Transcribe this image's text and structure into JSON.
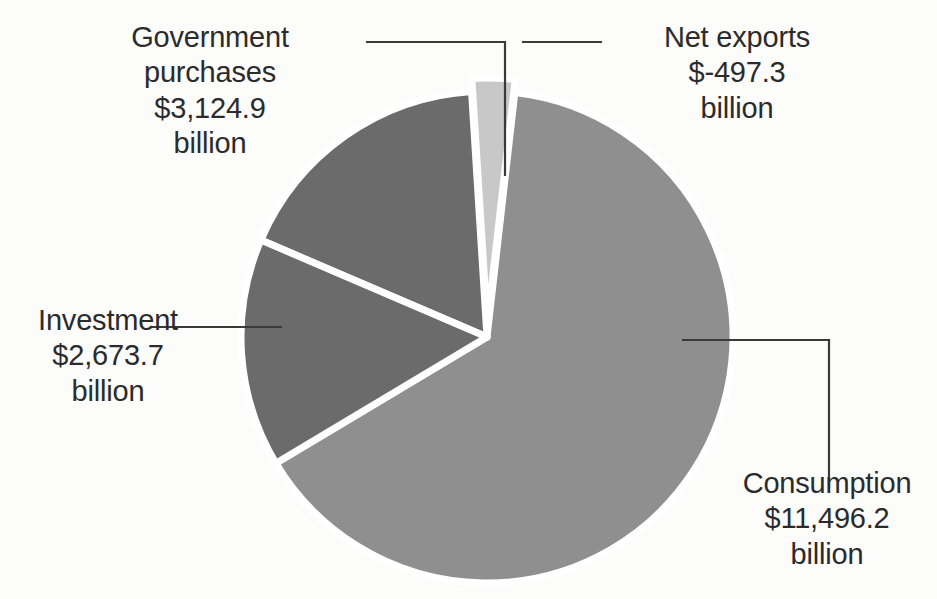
{
  "chart_data": {
    "type": "pie",
    "title": "",
    "subtitle": "",
    "xlabel": "",
    "ylabel": "",
    "units": "billion",
    "currency_symbol": "$",
    "legend_position": "callouts",
    "grid": false,
    "categories": [
      "Consumption",
      "Government purchases",
      "Investment",
      "Net exports"
    ],
    "values": [
      11496.2,
      3124.9,
      2673.7,
      -497.3
    ],
    "slices": [
      {
        "label": "Consumption",
        "value_text": "$11,496.2",
        "unit_text": "billion",
        "value": 11496.2,
        "color": "#8f8f8f",
        "start_angle": 6.5,
        "sweep_angle": 232.6,
        "exploded": false
      },
      {
        "label": "Government purchases",
        "value_text": "$3,124.9",
        "unit_text": "billion",
        "value": 3124.9,
        "color": "#6b6b6b",
        "start_angle": 293.2,
        "sweep_angle": 63.2,
        "exploded": false
      },
      {
        "label": "Investment",
        "value_text": "$2,673.7",
        "unit_text": "billion",
        "value": 2673.7,
        "color": "#6b6b6b",
        "start_angle": 239.1,
        "sweep_angle": 54.1,
        "exploded": false
      },
      {
        "label": "Net exports",
        "value_text": "$-497.3",
        "unit_text": "billion",
        "value": -497.3,
        "color": "#c8c8c8",
        "start_angle": 356.4,
        "sweep_angle": 10.1,
        "exploded": true
      }
    ]
  },
  "callouts": {
    "government": {
      "line1": "Government",
      "line2": "purchases",
      "line3": "$3,124.9",
      "line4": "billion"
    },
    "net_exports": {
      "line1": "Net exports",
      "line2": "$-497.3",
      "line3": "billion"
    },
    "investment": {
      "line1": "Investment",
      "line2": "$2,673.7",
      "line3": "billion"
    },
    "consumption": {
      "line1": "Consumption",
      "line2": "$11,496.2",
      "line3": "billion"
    }
  },
  "colors": {
    "background": "#fcfcfb",
    "slice_dark": "#6b6b6b",
    "slice_medium": "#8f8f8f",
    "slice_light": "#c8c8c8",
    "separator": "#ffffff",
    "leader_line": "#3a3a3a",
    "text": "#2b2b2b"
  },
  "geometry": {
    "center_x": 487,
    "center_y": 337,
    "radius": 246
  }
}
